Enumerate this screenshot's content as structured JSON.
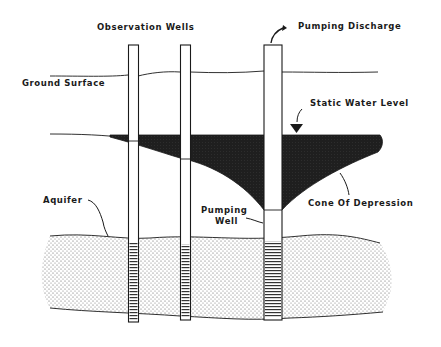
{
  "diagram": {
    "type": "groundwater cone of depression cross-section",
    "labels": {
      "observation_wells": "Observation Wells",
      "pumping_discharge": "Pumping Discharge",
      "ground_surface": "Ground Surface",
      "static_water_level": "Static Water Level",
      "cone_of_depression": "Cone Of Depression",
      "aquifer": "Aquifer",
      "pumping_well_line1": "Pumping",
      "pumping_well_line2": "Well"
    },
    "colors": {
      "line": "#1a1a1a",
      "water_fill": "#1f1f1f",
      "aquifer_dots": "#555555",
      "background": "#ffffff"
    }
  }
}
